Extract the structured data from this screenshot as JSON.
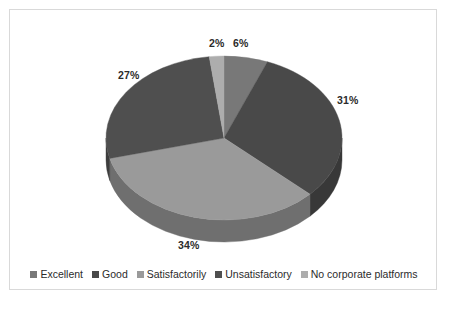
{
  "chart_data": {
    "type": "pie",
    "title": "",
    "subtitle": "",
    "xlabel": "",
    "ylabel": "",
    "three_d": true,
    "grid": false,
    "legend_position": "bottom",
    "start_angle_deg": 0,
    "direction": "clockwise",
    "categories": [
      "Excellent",
      "Good",
      "Satisfactorily",
      "Unsatisfactory",
      "No corporate platforms"
    ],
    "values": [
      6,
      31,
      34,
      27,
      2
    ],
    "value_unit": "%",
    "data_labels": [
      "6%",
      "31%",
      "34%",
      "27%",
      "2%"
    ],
    "slice_colors": [
      "#787878",
      "#494949",
      "#9a9a9a",
      "#4f4f4f",
      "#adadad"
    ],
    "slice_side_colors": [
      "#5c5c5c",
      "#383838",
      "#6f6f6f",
      "#3d3d3d",
      "#828282"
    ],
    "slices": [
      {
        "label": "Excellent",
        "value": 6,
        "display": "6%",
        "color": "#787878",
        "side_color": "#5c5c5c"
      },
      {
        "label": "Good",
        "value": 31,
        "display": "31%",
        "color": "#494949",
        "side_color": "#383838"
      },
      {
        "label": "Satisfactorily",
        "value": 34,
        "display": "34%",
        "color": "#9a9a9a",
        "side_color": "#6f6f6f"
      },
      {
        "label": "Unsatisfactory",
        "value": 27,
        "display": "27%",
        "color": "#4f4f4f",
        "side_color": "#3d3d3d"
      },
      {
        "label": "No corporate platforms",
        "value": 2,
        "display": "2%",
        "color": "#adadad",
        "side_color": "#828282"
      }
    ]
  },
  "legend": {
    "items": [
      {
        "label": "Excellent",
        "color": "#787878"
      },
      {
        "label": "Good",
        "color": "#494949"
      },
      {
        "label": "Satisfactorily",
        "color": "#9a9a9a"
      },
      {
        "label": "Unsatisfactory",
        "color": "#4f4f4f"
      },
      {
        "label": "No corporate platforms",
        "color": "#adadad"
      }
    ]
  },
  "style": {
    "background": "#ffffff",
    "border_color": "#d9d9d9",
    "label_color": "#2b2b2b"
  }
}
